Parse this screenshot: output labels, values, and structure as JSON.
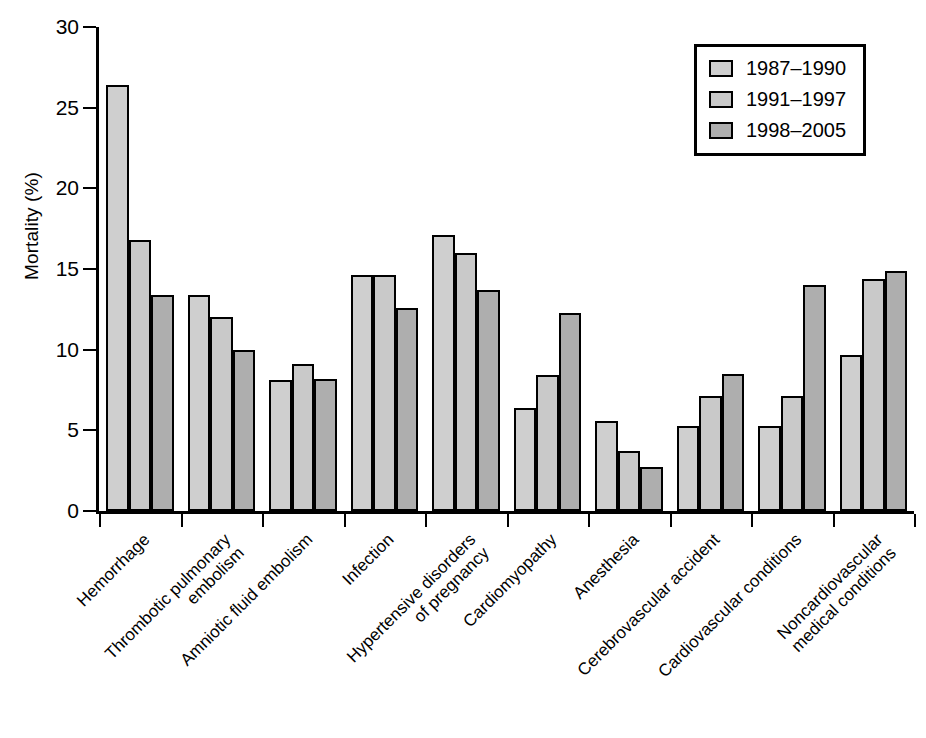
{
  "chart_data": {
    "type": "bar",
    "title": "",
    "subtitle": "",
    "xlabel": "",
    "ylabel": "Mortality (%)",
    "ylim": [
      0,
      30
    ],
    "ytick_labels": [
      "0",
      "5",
      "10",
      "15",
      "20",
      "25",
      "30"
    ],
    "ytick_values": [
      0,
      5,
      10,
      15,
      20,
      25,
      30
    ],
    "grid": false,
    "legend_position": "top-right",
    "orientation": "vertical",
    "grouping": "grouped",
    "categories": [
      "Hemorrhage",
      "Thrombotic pulmonary embolism",
      "Amniotic fluid embolism",
      "Infection",
      "Hypertensive disorders of pregnancy",
      "Cardiomyopathy",
      "Anesthesia",
      "Cerebrovascular accident",
      "Cardiovascular conditions",
      "Noncardiovascular medical conditions"
    ],
    "category_label_lines": [
      [
        "Hemorrhage"
      ],
      [
        "Thrombotic pulmonary",
        "embolism"
      ],
      [
        "Amniotic fluid embolism"
      ],
      [
        "Infection"
      ],
      [
        "Hypertensive disorders",
        "of pregnancy"
      ],
      [
        "Cardiomyopathy"
      ],
      [
        "Anesthesia"
      ],
      [
        "Cerebrovascular accident"
      ],
      [
        "Cardiovascular conditions"
      ],
      [
        "Noncardiovascular",
        "medical conditions"
      ]
    ],
    "series": [
      {
        "name": "1987–1990",
        "color": "#cfcfcf",
        "values": [
          26.4,
          13.4,
          8.1,
          14.6,
          17.1,
          6.4,
          5.6,
          5.3,
          5.3,
          9.7
        ]
      },
      {
        "name": "1991–1997",
        "color": "#c9c9c9",
        "values": [
          16.8,
          12.0,
          9.1,
          14.6,
          16.0,
          8.4,
          3.7,
          7.1,
          7.1,
          14.4
        ]
      },
      {
        "name": "1998–2005",
        "color": "#aeaeae",
        "values": [
          13.4,
          10.0,
          8.2,
          12.6,
          13.7,
          12.3,
          2.7,
          8.5,
          14.0,
          14.9
        ]
      }
    ],
    "bar_outline_color": "#000000",
    "axis_color": "#000000",
    "background_color": "#ffffff"
  },
  "legend": {
    "entries": [
      {
        "label": "1987–1990"
      },
      {
        "label": "1991–1997"
      },
      {
        "label": "1998–2005"
      }
    ]
  }
}
